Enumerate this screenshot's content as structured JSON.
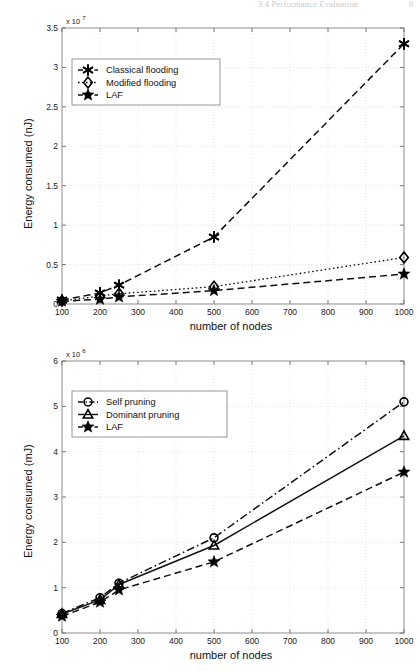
{
  "header": {
    "running_head": "3.4  Performance Evaluation",
    "page_number": "6"
  },
  "figures": [
    {
      "id": "top",
      "exponent_label": "x 10",
      "exponent_sup": "7",
      "ylabel": "Energy consumed (nJ)",
      "xlabel": "number of nodes",
      "legend": [
        {
          "label": "Classical flooding",
          "marker": "asterisk",
          "line": "dashed"
        },
        {
          "label": "Modified flooding",
          "marker": "diamond",
          "line": "dotted"
        },
        {
          "label": "LAF",
          "marker": "star",
          "line": "dashed"
        }
      ]
    },
    {
      "id": "bottom",
      "exponent_label": "x 10",
      "exponent_sup": "6",
      "ylabel": "Energy consumed (mJ)",
      "xlabel": "number of nodes",
      "legend": [
        {
          "label": "Self pruning",
          "marker": "circle",
          "line": "dashdot"
        },
        {
          "label": "Dominant pruning",
          "marker": "triangle",
          "line": "solid"
        },
        {
          "label": "LAF",
          "marker": "star",
          "line": "dashed"
        }
      ]
    }
  ],
  "chart_data": [
    {
      "type": "line",
      "title": "",
      "xlabel": "number of nodes",
      "ylabel": "Energy consumed (nJ)",
      "y_exponent": "x 10^7",
      "xlim": [
        100,
        1000
      ],
      "ylim": [
        0,
        3.5
      ],
      "xticks": [
        100,
        200,
        300,
        400,
        500,
        600,
        700,
        800,
        900,
        1000
      ],
      "yticks": [
        0,
        0.5,
        1,
        1.5,
        2,
        2.5,
        3,
        3.5
      ],
      "grid": true,
      "legend_position": "upper-left-inset",
      "x": [
        100,
        200,
        250,
        500,
        1000
      ],
      "series": [
        {
          "name": "Classical flooding",
          "marker": "asterisk",
          "line": "dashed",
          "values": [
            0.05,
            0.14,
            0.24,
            0.85,
            3.3
          ]
        },
        {
          "name": "Modified flooding",
          "marker": "diamond",
          "line": "dotted",
          "values": [
            0.04,
            0.1,
            0.13,
            0.22,
            0.59
          ]
        },
        {
          "name": "LAF",
          "marker": "star",
          "line": "dashed",
          "values": [
            0.035,
            0.06,
            0.09,
            0.17,
            0.38
          ]
        }
      ]
    },
    {
      "type": "line",
      "title": "",
      "xlabel": "number of nodes",
      "ylabel": "Energy consumed (mJ)",
      "y_exponent": "x 10^6",
      "xlim": [
        100,
        1000
      ],
      "ylim": [
        0,
        6
      ],
      "xticks": [
        100,
        200,
        300,
        400,
        500,
        600,
        700,
        800,
        900,
        1000
      ],
      "yticks": [
        0,
        1,
        2,
        3,
        4,
        5,
        6
      ],
      "grid": true,
      "legend_position": "upper-left-inset",
      "x": [
        100,
        200,
        250,
        500,
        1000
      ],
      "series": [
        {
          "name": "Self pruning",
          "marker": "circle",
          "line": "dashdot",
          "values": [
            0.43,
            0.78,
            1.1,
            2.1,
            5.1
          ]
        },
        {
          "name": "Dominant pruning",
          "marker": "triangle",
          "line": "solid",
          "values": [
            0.42,
            0.73,
            1.07,
            1.93,
            4.35
          ]
        },
        {
          "name": "LAF",
          "marker": "star",
          "line": "dashed",
          "values": [
            0.37,
            0.68,
            0.95,
            1.57,
            3.55
          ]
        }
      ]
    }
  ]
}
